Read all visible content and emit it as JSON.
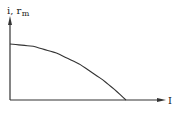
{
  "chart_data": {
    "type": "line",
    "title": "",
    "xlabel": "I",
    "ylabel": "i, r_m",
    "ylabel_main": "i, r",
    "ylabel_sub": "m",
    "grid": false,
    "legend": null,
    "axis_ticks": "none",
    "series": [
      {
        "name": "i, r_m vs I",
        "description": "Starts at a finite maximum at I=0, stays nearly flat, then falls off increasingly steeply to zero",
        "x": [
          0,
          0.2,
          0.4,
          0.6,
          0.8,
          0.9,
          1.0
        ],
        "values": [
          1.0,
          0.96,
          0.84,
          0.64,
          0.36,
          0.19,
          0.0
        ]
      }
    ],
    "xlim": [
      0,
      1.3
    ],
    "ylim": [
      0,
      1.5
    ]
  },
  "colors": {
    "line": "#333333",
    "background": "#ffffff"
  }
}
